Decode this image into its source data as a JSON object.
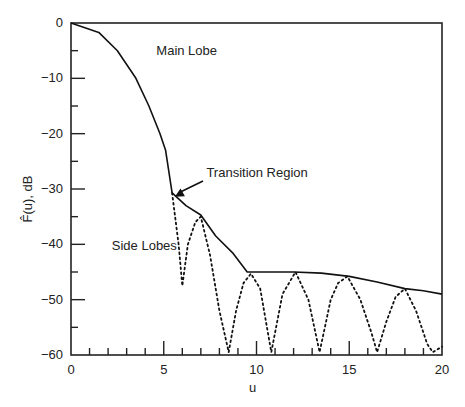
{
  "chart_data": {
    "type": "line",
    "title": "",
    "xlabel": "u",
    "ylabel": "F̂(u), dB",
    "xlim": [
      0,
      20
    ],
    "ylim": [
      -60,
      0
    ],
    "xticks_major": [
      0,
      5,
      10,
      15,
      20
    ],
    "yticks_major": [
      0,
      -10,
      -20,
      -30,
      -40,
      -50,
      -60
    ],
    "x_tick_labels": [
      "0",
      "5",
      "10",
      "15",
      "20"
    ],
    "y_tick_labels": [
      "0",
      "−10",
      "−20",
      "−30",
      "−40",
      "−50",
      "−60"
    ],
    "grid": false,
    "legend": null,
    "series": [
      {
        "name": "Envelope (solid)",
        "style": "solid",
        "x": [
          0,
          1.5,
          2.5,
          3.5,
          4.2,
          4.8,
          5.1,
          5.45,
          6.2,
          7.0,
          7.8,
          8.7,
          9.5,
          10.5,
          12.0,
          13.5,
          15.0,
          16.5,
          18.0,
          19.0,
          20.0
        ],
        "y": [
          0,
          -1.7,
          -5,
          -10,
          -15,
          -20,
          -23,
          -30.7,
          -33,
          -34.7,
          -38.5,
          -41.5,
          -45,
          -45,
          -45,
          -45.2,
          -45.8,
          -46.8,
          -48,
          -48.4,
          -49
        ]
      },
      {
        "name": "Side lobes (dotted)",
        "style": "dotted",
        "x": [
          5.45,
          5.8,
          6.0,
          6.3,
          6.7,
          7.0,
          7.5,
          8.0,
          8.5,
          8.9,
          9.3,
          9.7,
          10.2,
          10.8,
          11.4,
          12.1,
          12.8,
          13.4,
          14.0,
          14.4,
          14.9,
          15.6,
          16.2,
          16.5,
          17.0,
          17.5,
          18.0,
          18.6,
          19.2,
          19.5,
          20.0
        ],
        "y": [
          -30.7,
          -40,
          -47.5,
          -40,
          -36,
          -35,
          -42,
          -52,
          -59.5,
          -52,
          -47,
          -45.3,
          -48,
          -59.5,
          -49,
          -45,
          -50,
          -59.5,
          -50,
          -47,
          -45.8,
          -50,
          -56,
          -59.5,
          -54,
          -49.5,
          -48,
          -52,
          -58,
          -59.5,
          -58.5
        ]
      }
    ],
    "annotations": [
      {
        "text": "Main Lobe",
        "x": 4.6,
        "y": -5.8
      },
      {
        "text": "Transition Region",
        "x": 7.3,
        "y": -27.8,
        "arrow_to": [
          5.6,
          -31.4
        ]
      },
      {
        "text": "Side Lobes",
        "x": 2.2,
        "y": -41
      }
    ]
  }
}
